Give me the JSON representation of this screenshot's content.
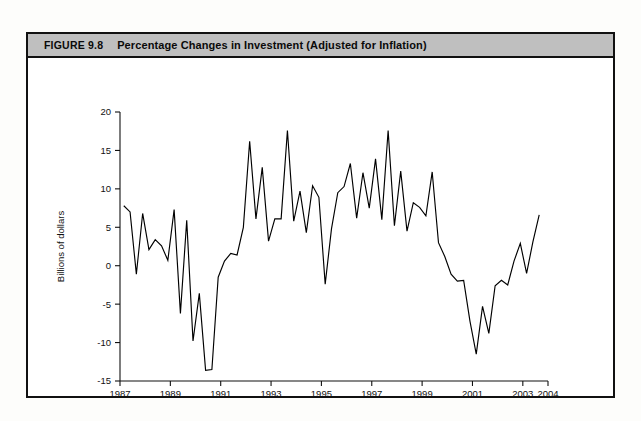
{
  "figure": {
    "number_label": "FIGURE 9.8",
    "title": "Percentage Changes in Investment (Adjusted for Inflation)"
  },
  "chart_data": {
    "type": "line",
    "title": "Percentage Changes in Investment (Adjusted for Inflation)",
    "xlabel": "Period-to-period percentage change at annual rates",
    "ylabel": "Billions of dollars",
    "xlim": [
      1987,
      2004
    ],
    "ylim": [
      -15,
      20
    ],
    "ytick_values": [
      20,
      15,
      10,
      5,
      0,
      -5,
      -10,
      -15
    ],
    "ytick_labels": [
      "20",
      "15",
      "10",
      "5",
      "0",
      "-5",
      "-10",
      "-15"
    ],
    "xtick_values": [
      1987,
      1989,
      1991,
      1993,
      1995,
      1997,
      1999,
      2001,
      2003,
      2004
    ],
    "xtick_labels": [
      "1987",
      "1989",
      "1991",
      "1993",
      "1995",
      "1997",
      "1999",
      "2001",
      "2003",
      "2004"
    ],
    "grid": false,
    "legend": false,
    "series": [
      {
        "name": "Percentage change in investment",
        "color": "#000000",
        "x": [
          1987.15,
          1987.4,
          1987.65,
          1987.9,
          1988.15,
          1988.4,
          1988.65,
          1988.9,
          1989.15,
          1989.4,
          1989.65,
          1989.9,
          1990.15,
          1990.4,
          1990.65,
          1990.9,
          1991.15,
          1991.4,
          1991.65,
          1991.9,
          1992.15,
          1992.4,
          1992.65,
          1992.9,
          1993.15,
          1993.4,
          1993.65,
          1993.9,
          1994.15,
          1994.4,
          1994.65,
          1994.9,
          1995.15,
          1995.4,
          1995.65,
          1995.9,
          1996.15,
          1996.4,
          1996.65,
          1996.9,
          1997.15,
          1997.4,
          1997.65,
          1997.9,
          1998.15,
          1998.4,
          1998.65,
          1998.9,
          1999.15,
          1999.4,
          1999.65,
          1999.9,
          2000.15,
          2000.4,
          2000.65,
          2000.9,
          2001.15,
          2001.4,
          2001.65,
          2001.9,
          2002.15,
          2002.4,
          2002.65,
          2002.9,
          2003.15,
          2003.4,
          2003.65
        ],
        "y": [
          7.8,
          7.0,
          -1.1,
          6.8,
          2.1,
          3.4,
          2.6,
          0.7,
          7.3,
          -6.2,
          5.9,
          -9.8,
          -3.6,
          -13.6,
          -13.5,
          -1.5,
          0.6,
          1.6,
          1.4,
          5.0,
          16.2,
          6.1,
          12.8,
          3.2,
          6.1,
          6.1,
          17.6,
          5.8,
          9.7,
          4.3,
          10.4,
          8.9,
          -2.4,
          4.8,
          9.5,
          10.3,
          13.3,
          6.2,
          12.1,
          7.5,
          13.9,
          6.0,
          17.6,
          5.2,
          12.3,
          4.5,
          8.2,
          7.6,
          6.5,
          12.2,
          3.0,
          1.2,
          -1.1,
          -2.0,
          -1.9,
          -7.2,
          -11.5,
          -5.3,
          -8.8,
          -2.6,
          -1.9,
          -2.5,
          0.6,
          2.9,
          -1.0,
          3.1,
          6.6
        ]
      }
    ]
  }
}
